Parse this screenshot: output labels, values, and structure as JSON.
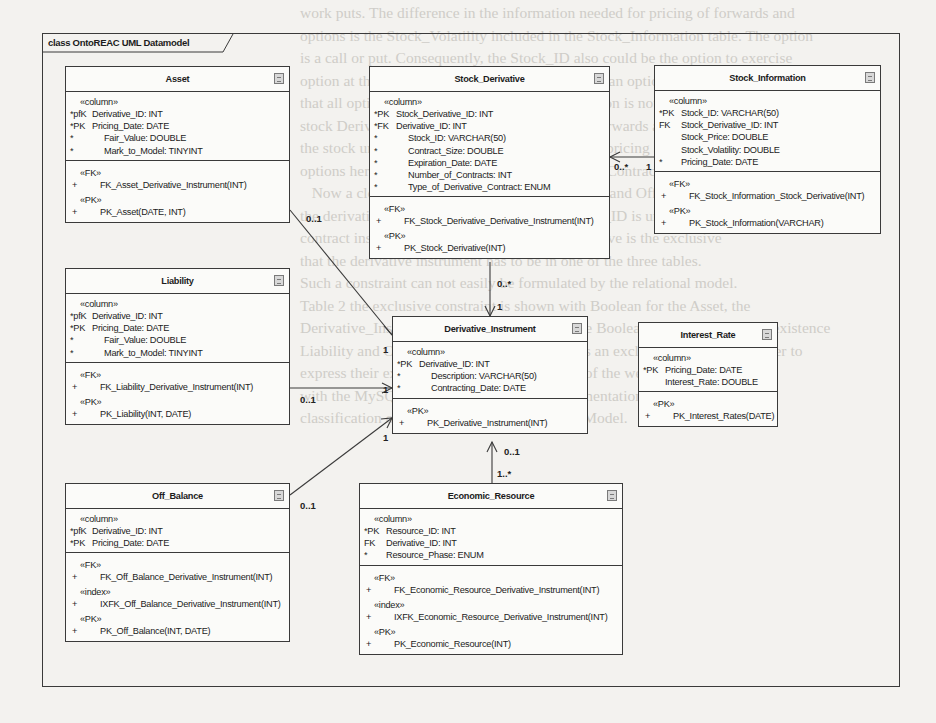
{
  "background_text": [
    "work puts. The difference in the information needed for pricing of forwards and",
    "options is the Stock_Volatility included in the Stock_Information table. The option",
    "is a call or put. Consequently, the Stock_ID also could be the option to exercise",
    "option at the expiration date in the case of European options [8] only in a sense",
    "that all options are long. In Table 1 this information is not needed in the",
    "stock Derivative table. The difference between forwards and options is the",
    "the stock underlying as of measurement. Mainly, pricing and the prices of",
    "options here used are described in the Derivative Contract.",
    "   Now a closer look on the tables Asset, Liability and Off_Balance shows",
    "the derivative instrument is clear. The Derivative_ID is unique for each",
    "contract instance. Whilst making sure the derivative is the exclusive",
    "that the derivative instrument has to be in one of the three tables.",
    "Such a constraint can not easily be formulated by the relational model.",
    "Table 2 the exclusive constraint is shown with Boolean for the Asset, the",
    "Derivative_Instrument table. After defining the Boolean expressions for the existence",
    "Liability and Off_Balance may be classified as an exclusive condition in order to",
    "express their exclusiveness. The combination of the well-defined exclusivity",
    "with the MySQL database ERM model implementation ensures the correct",
    "classification of derivative instruments in the Model."
  ],
  "diagram": {
    "frame_title": "class OntoREAC UML Datamodel",
    "tables": {
      "asset": {
        "name": "Asset",
        "column_stereotype": "«column»",
        "columns": [
          {
            "key": "*pfK",
            "name": "Derivative_ID: INT",
            "indent": false
          },
          {
            "key": "*PK",
            "name": "Pricing_Date: DATE",
            "indent": false
          },
          {
            "key": "*",
            "name": "Fair_Value: DOUBLE",
            "indent": true
          },
          {
            "key": "*",
            "name": "Mark_to_Model: TINYINT",
            "indent": true
          }
        ],
        "op_groups": [
          {
            "stereotype": "«FK»",
            "ops": [
              {
                "key": "+",
                "name": "FK_Asset_Derivative_Instrument(INT)"
              }
            ]
          },
          {
            "stereotype": "«PK»",
            "ops": [
              {
                "key": "+",
                "name": "PK_Asset(DATE, INT)"
              }
            ]
          }
        ]
      },
      "stock_derivative": {
        "name": "Stock_Derivative",
        "column_stereotype": "«column»",
        "columns": [
          {
            "key": "*PK",
            "name": "Stock_Derivative_ID: INT",
            "indent": false
          },
          {
            "key": "*FK",
            "name": "Derivative_ID: INT",
            "indent": false
          },
          {
            "key": "*",
            "name": "Stock_ID: VARCHAR(50)",
            "indent": true
          },
          {
            "key": "*",
            "name": "Contract_Size: DOUBLE",
            "indent": true
          },
          {
            "key": "*",
            "name": "Expiration_Date: DATE",
            "indent": true
          },
          {
            "key": "*",
            "name": "Number_of_Contracts: INT",
            "indent": true
          },
          {
            "key": "*",
            "name": "Type_of_Derivative_Contract: ENUM",
            "indent": true
          }
        ],
        "op_groups": [
          {
            "stereotype": "«FK»",
            "ops": [
              {
                "key": "+",
                "name": "FK_Stock_Derivative_Derivative_Instrument(INT)"
              }
            ]
          },
          {
            "stereotype": "«PK»",
            "ops": [
              {
                "key": "+",
                "name": "PK_Stock_Derivative(INT)"
              }
            ]
          }
        ]
      },
      "stock_information": {
        "name": "Stock_Information",
        "column_stereotype": "«column»",
        "columns": [
          {
            "key": "*PK",
            "name": "Stock_ID: VARCHAR(50)",
            "indent": false
          },
          {
            "key": "FK",
            "name": "Stock_Derivative_ID: INT",
            "indent": false
          },
          {
            "key": "",
            "name": "Stock_Price: DOUBLE",
            "indent": false
          },
          {
            "key": "",
            "name": "Stock_Volatility: DOUBLE",
            "indent": false
          },
          {
            "key": "*",
            "name": "Pricing_Date: DATE",
            "indent": false
          }
        ],
        "op_groups": [
          {
            "stereotype": "«FK»",
            "ops": [
              {
                "key": "+",
                "name": "FK_Stock_Information_Stock_Derivative(INT)"
              }
            ]
          },
          {
            "stereotype": "«PK»",
            "ops": [
              {
                "key": "+",
                "name": "PK_Stock_Information(VARCHAR)"
              }
            ]
          }
        ]
      },
      "liability": {
        "name": "Liability",
        "column_stereotype": "«column»",
        "columns": [
          {
            "key": "*pfK",
            "name": "Derivative_ID: INT",
            "indent": false
          },
          {
            "key": "*PK",
            "name": "Pricing_Date: DATE",
            "indent": false
          },
          {
            "key": "*",
            "name": "Fair_Value: DOUBLE",
            "indent": true
          },
          {
            "key": "*",
            "name": "Mark_to_Model: TINYINT",
            "indent": true
          }
        ],
        "op_groups": [
          {
            "stereotype": "«FK»",
            "ops": [
              {
                "key": "+",
                "name": "FK_Liability_Derivative_Instrument(INT)"
              }
            ]
          },
          {
            "stereotype": "«PK»",
            "ops": [
              {
                "key": "+",
                "name": "PK_Liability(INT, DATE)"
              }
            ]
          }
        ]
      },
      "derivative_instrument": {
        "name": "Derivative_Instrument",
        "column_stereotype": "«column»",
        "columns": [
          {
            "key": "*PK",
            "name": "Derivative_ID: INT",
            "indent": false
          },
          {
            "key": "*",
            "name": "Description: VARCHAR(50)",
            "indent": true
          },
          {
            "key": "*",
            "name": "Contracting_Date: DATE",
            "indent": true
          }
        ],
        "op_groups": [
          {
            "stereotype": "«PK»",
            "ops": [
              {
                "key": "+",
                "name": "PK_Derivative_Instrument(INT)"
              }
            ]
          }
        ]
      },
      "interest_rate": {
        "name": "Interest_Rate",
        "column_stereotype": "«column»",
        "columns": [
          {
            "key": "*PK",
            "name": "Pricing_Date: DATE",
            "indent": false
          },
          {
            "key": "",
            "name": "Interest_Rate: DOUBLE",
            "indent": false
          }
        ],
        "op_groups": [
          {
            "stereotype": "«PK»",
            "ops": [
              {
                "key": "+",
                "name": "PK_Interest_Rates(DATE)"
              }
            ]
          }
        ]
      },
      "off_balance": {
        "name": "Off_Balance",
        "column_stereotype": "«column»",
        "columns": [
          {
            "key": "*pfK",
            "name": "Derivative_ID: INT",
            "indent": false
          },
          {
            "key": "*PK",
            "name": "Pricing_Date: DATE",
            "indent": false
          }
        ],
        "op_groups": [
          {
            "stereotype": "«FK»",
            "ops": [
              {
                "key": "+",
                "name": "FK_Off_Balance_Derivative_Instrument(INT)"
              }
            ]
          },
          {
            "stereotype": "«index»",
            "ops": [
              {
                "key": "+",
                "name": "IXFK_Off_Balance_Derivative_Instrument(INT)"
              }
            ]
          },
          {
            "stereotype": "«PK»",
            "ops": [
              {
                "key": "+",
                "name": "PK_Off_Balance(INT, DATE)"
              }
            ]
          }
        ]
      },
      "economic_resource": {
        "name": "Economic_Resource",
        "column_stereotype": "«column»",
        "columns": [
          {
            "key": "*PK",
            "name": "Resource_ID: INT",
            "indent": false
          },
          {
            "key": "FK",
            "name": "Derivative_ID: INT",
            "indent": false
          },
          {
            "key": "*",
            "name": "Resource_Phase: ENUM",
            "indent": false
          }
        ],
        "op_groups": [
          {
            "stereotype": "«FK»",
            "ops": [
              {
                "key": "+",
                "name": "FK_Economic_Resource_Derivative_Instrument(INT)"
              }
            ]
          },
          {
            "stereotype": "«index»",
            "ops": [
              {
                "key": "+",
                "name": "IXFK_Economic_Resource_Derivative_Instrument(INT)"
              }
            ]
          },
          {
            "stereotype": "«PK»",
            "ops": [
              {
                "key": "+",
                "name": "PK_Economic_Resource(INT)"
              }
            ]
          }
        ]
      }
    },
    "multiplicities": {
      "asset_src": "0..1",
      "asset_dst": "1",
      "liability_src": "0..1",
      "liability_dst": "1",
      "offbal_src": "0..1",
      "offbal_dst": "1",
      "stockder_src": "0..*",
      "stockder_dst": "1",
      "stockinfo_src": "1",
      "stockinfo_dst": "0..*",
      "econ_src": "1..*",
      "econ_dst": "0..1"
    },
    "colors": {
      "line": "#3a3a3a",
      "box_fill": "#fbfbf9",
      "page": "#f3f2ef"
    }
  }
}
